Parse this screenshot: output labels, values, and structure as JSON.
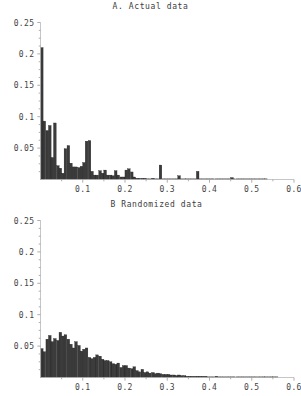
{
  "figure": {
    "width": 301,
    "height": 396,
    "background": "#ffffff",
    "bar_color": "#3b3b3b",
    "axis_color": "#b8b8b8"
  },
  "panels": [
    {
      "id": "a",
      "title": "A. Actual data"
    },
    {
      "id": "b",
      "title": "B Randomized data"
    }
  ],
  "chart_data": [
    {
      "type": "bar",
      "title": "A. Actual data",
      "xlabel": "",
      "ylabel": "",
      "xlim": [
        0,
        0.6
      ],
      "ylim": [
        0,
        0.25
      ],
      "grid": false,
      "legend": "none",
      "bin_width": 0.00625,
      "xticks": [
        0.1,
        0.2,
        0.3,
        0.4,
        0.5,
        0.6
      ],
      "xtick_labels": [
        "0.1",
        "0.2",
        "0.3",
        "0.4",
        "0.5",
        "0.6"
      ],
      "yticks": [
        0.05,
        0.1,
        0.15,
        0.2,
        0.25
      ],
      "ytick_labels": [
        "0.05",
        "0.1",
        "0.15",
        "0.2",
        "0.25"
      ],
      "x": [
        0.003,
        0.009,
        0.016,
        0.022,
        0.028,
        0.034,
        0.041,
        0.047,
        0.053,
        0.059,
        0.066,
        0.072,
        0.078,
        0.084,
        0.091,
        0.097,
        0.103,
        0.109,
        0.116,
        0.122,
        0.128,
        0.134,
        0.141,
        0.147,
        0.153,
        0.159,
        0.166,
        0.172,
        0.178,
        0.184,
        0.191,
        0.197,
        0.203,
        0.209,
        0.216,
        0.222,
        0.228,
        0.234,
        0.241,
        0.247,
        0.253,
        0.259,
        0.266,
        0.272,
        0.278,
        0.284,
        0.291,
        0.297,
        0.303,
        0.309,
        0.316,
        0.322,
        0.328,
        0.334,
        0.341,
        0.347,
        0.353,
        0.359,
        0.366,
        0.372,
        0.378,
        0.384,
        0.391,
        0.397,
        0.403,
        0.409,
        0.416,
        0.422,
        0.428,
        0.434,
        0.441,
        0.447,
        0.453,
        0.459,
        0.466,
        0.472,
        0.478,
        0.484,
        0.491,
        0.497,
        0.503,
        0.509,
        0.516,
        0.522,
        0.528,
        0.534
      ],
      "values": [
        0.21,
        0.093,
        0.078,
        0.086,
        0.035,
        0.09,
        0.022,
        0.018,
        0.01,
        0.049,
        0.054,
        0.026,
        0.02,
        0.02,
        0.019,
        0.021,
        0.027,
        0.061,
        0.062,
        0.013,
        0.007,
        0.007,
        0.014,
        0.01,
        0.015,
        0.007,
        0.007,
        0.006,
        0.014,
        0.007,
        0.004,
        0.004,
        0.015,
        0.017,
        0.012,
        0.004,
        0.002,
        0.002,
        0.002,
        0.002,
        0.001,
        0.001,
        0.002,
        0.001,
        0.001,
        0.023,
        0.001,
        0.001,
        0.001,
        0.001,
        0.001,
        0.001,
        0.006,
        0.001,
        0.001,
        0.001,
        0.001,
        0.001,
        0.001,
        0.013,
        0.001,
        0.001,
        0.001,
        0.001,
        0.001,
        0.001,
        0.001,
        0.001,
        0.001,
        0.001,
        0.001,
        0.001,
        0.003,
        0.001,
        0.001,
        0.001,
        0.001,
        0.001,
        0.001,
        0.001,
        0.001,
        0.001,
        0.001,
        0.001,
        0.001,
        0.001
      ]
    },
    {
      "type": "bar",
      "title": "B Randomized data",
      "xlabel": "",
      "ylabel": "",
      "xlim": [
        0,
        0.6
      ],
      "ylim": [
        0,
        0.25
      ],
      "grid": false,
      "legend": "none",
      "bin_width": 0.00625,
      "xticks": [
        0.1,
        0.2,
        0.3,
        0.4,
        0.5,
        0.6
      ],
      "xtick_labels": [
        "0.1",
        "0.2",
        "0.3",
        "0.4",
        "0.5",
        "0.6"
      ],
      "yticks": [
        0.05,
        0.1,
        0.15,
        0.2,
        0.25
      ],
      "ytick_labels": [
        "0.05",
        "0.1",
        "0.15",
        "0.2",
        "0.25"
      ],
      "x": [
        0.003,
        0.009,
        0.016,
        0.022,
        0.028,
        0.034,
        0.041,
        0.047,
        0.053,
        0.059,
        0.066,
        0.072,
        0.078,
        0.084,
        0.091,
        0.097,
        0.103,
        0.109,
        0.116,
        0.122,
        0.128,
        0.134,
        0.141,
        0.147,
        0.153,
        0.159,
        0.166,
        0.172,
        0.178,
        0.184,
        0.191,
        0.197,
        0.203,
        0.209,
        0.216,
        0.222,
        0.228,
        0.234,
        0.241,
        0.247,
        0.253,
        0.259,
        0.266,
        0.272,
        0.278,
        0.284,
        0.291,
        0.297,
        0.303,
        0.309,
        0.316,
        0.322,
        0.328,
        0.334,
        0.341,
        0.347,
        0.353,
        0.359,
        0.366,
        0.372,
        0.378,
        0.384,
        0.391,
        0.397,
        0.403,
        0.409,
        0.416,
        0.422,
        0.428,
        0.434,
        0.441,
        0.447,
        0.453,
        0.459,
        0.466,
        0.472,
        0.478,
        0.484,
        0.491,
        0.497,
        0.503,
        0.509,
        0.516,
        0.522,
        0.528,
        0.534,
        0.541,
        0.547,
        0.553,
        0.559
      ],
      "values": [
        0.046,
        0.041,
        0.061,
        0.067,
        0.057,
        0.062,
        0.059,
        0.072,
        0.066,
        0.068,
        0.061,
        0.053,
        0.047,
        0.057,
        0.051,
        0.042,
        0.045,
        0.047,
        0.032,
        0.03,
        0.032,
        0.036,
        0.034,
        0.029,
        0.027,
        0.027,
        0.025,
        0.022,
        0.021,
        0.023,
        0.016,
        0.019,
        0.019,
        0.015,
        0.014,
        0.017,
        0.011,
        0.009,
        0.013,
        0.008,
        0.009,
        0.007,
        0.008,
        0.006,
        0.007,
        0.006,
        0.005,
        0.005,
        0.005,
        0.004,
        0.004,
        0.003,
        0.004,
        0.003,
        0.003,
        0.002,
        0.002,
        0.002,
        0.002,
        0.002,
        0.002,
        0.002,
        0.002,
        0.001,
        0.001,
        0.001,
        0.002,
        0.001,
        0.001,
        0.001,
        0.001,
        0.001,
        0.001,
        0.001,
        0.001,
        0.001,
        0.001,
        0.001,
        0.001,
        0.001,
        0.001,
        0.001,
        0.001,
        0.001,
        0.001,
        0.001,
        0.001,
        0.001,
        0.001,
        0.001
      ]
    }
  ]
}
